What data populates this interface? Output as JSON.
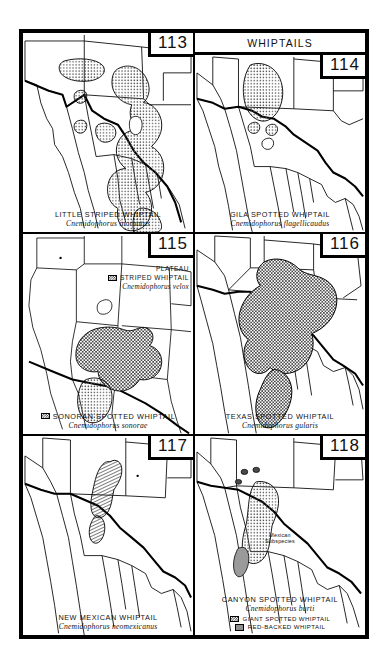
{
  "plate": {
    "header_label": "WHIPTAILS"
  },
  "panels": [
    {
      "number": "113",
      "common_name": "LITTLE STRIPED WHIPTAIL",
      "scientific_name": "Cnemidophorus inornatus",
      "has_header": false,
      "range_fill": "dotted"
    },
    {
      "number": "114",
      "common_name": "GILA SPOTTED WHIPTAIL",
      "scientific_name": "Cnemidophorus flagellicaudus",
      "has_header": true,
      "range_fill": "dotted"
    },
    {
      "number": "115",
      "common_name": "SONORAN SPOTTED WHIPTAIL",
      "scientific_name": "Cnemidophorus sonorae",
      "has_header": false,
      "range_fill": "dotted",
      "inset_legend": {
        "line1": "PLATEAU",
        "line2": "STRIPED WHIPTAIL",
        "scientific_name": "Cnemidophorus velox",
        "swatch": "check"
      },
      "caption_swatch": "check"
    },
    {
      "number": "116",
      "common_name": "TEXAS SPOTTED WHIPTAIL",
      "scientific_name": "Cnemidophorus gularis",
      "has_header": false,
      "range_fill": "check"
    },
    {
      "number": "117",
      "common_name": "NEW MEXICAN WHIPTAIL",
      "scientific_name": "Cnemidophorus neomexicanus",
      "has_header": false,
      "range_fill": "hatch"
    },
    {
      "number": "118",
      "common_name": "CANYON SPOTTED WHIPTAIL",
      "scientific_name": "Cnemidophorus burti",
      "has_header": false,
      "range_fill": "dotted",
      "map_label": "Mexican\nSubspecies",
      "map_label_line1": "Mexican",
      "map_label_line2": "Subspecies",
      "sub_legend": [
        {
          "label": "GIANT SPOTTED WHIPTAIL",
          "swatch": "check"
        },
        {
          "label": "RED-BACKED WHIPTAIL",
          "swatch": "solid"
        }
      ]
    }
  ],
  "colors": {
    "ink": "#000000",
    "paper": "#ffffff",
    "range_gray": "#8f8f8f",
    "stipple": "#555555"
  }
}
